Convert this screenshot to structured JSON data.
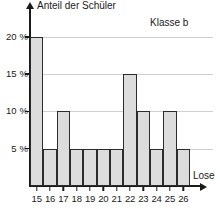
{
  "chart_data": {
    "type": "bar",
    "title": "",
    "annotation": "Klasse b",
    "xlabel": "Lose",
    "ylabel": "Anteil der Schüler",
    "categories": [
      "15",
      "16",
      "17",
      "18",
      "19",
      "20",
      "21",
      "22",
      "23",
      "24",
      "25",
      "26"
    ],
    "values": [
      20,
      5,
      10,
      5,
      5,
      5,
      5,
      15,
      10,
      5,
      10,
      5
    ],
    "ylim": [
      0,
      22
    ],
    "yticks": [
      5,
      10,
      15,
      20
    ],
    "ytick_labels": [
      "5 %",
      "10 %",
      "15 %",
      "20 %"
    ],
    "grid": true,
    "legend": "none",
    "bar_fill": "#dcdcdc",
    "bar_stroke": "#2b2b2b",
    "grid_color": "#d0d0d0",
    "axis_color": "#1a1a1a"
  }
}
